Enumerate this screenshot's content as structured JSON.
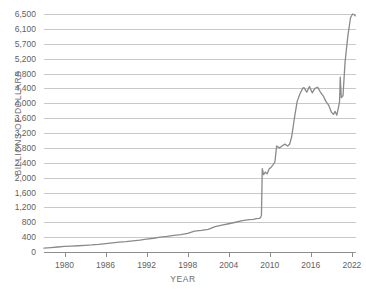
{
  "chart_data": {
    "type": "line",
    "title": "",
    "xlabel": "YEAR",
    "ylabel": "BILLIONS OF DOLLARS",
    "xlim": [
      1977,
      2022.6
    ],
    "ylim": [
      0,
      6500
    ],
    "grid": true,
    "legend": false,
    "line_color": "#8a8a8a",
    "xticks": [
      1980,
      1986,
      1992,
      1998,
      2004,
      2010,
      2016,
      2022
    ],
    "xtick_labels": [
      "1980",
      "1986",
      "1992",
      "1998",
      "2004",
      "2010",
      "2016",
      "2022"
    ],
    "yticks": [
      0,
      400,
      800,
      1200,
      1600,
      2000,
      2400,
      2800,
      3200,
      3600,
      4000,
      4400,
      4800,
      5200,
      5700,
      6100,
      6500
    ],
    "ytick_labels": [
      "0",
      "400",
      "800",
      "1,200",
      "1,600",
      "2,000",
      "2,400",
      "2,800",
      "3,200",
      "3,600",
      "4,000",
      "4,400",
      "4,800",
      "5,200",
      "5,700",
      "6,100",
      "6,500"
    ],
    "series": [
      {
        "name": "Total Assets",
        "x": [
          1977.0,
          1978.0,
          1979.0,
          1980.0,
          1981.0,
          1982.0,
          1983.0,
          1984.0,
          1985.0,
          1986.0,
          1987.0,
          1988.0,
          1989.0,
          1990.0,
          1991.0,
          1992.0,
          1993.0,
          1994.0,
          1995.0,
          1996.0,
          1997.0,
          1998.0,
          1999.0,
          2000.0,
          2001.0,
          2002.0,
          2003.0,
          2004.0,
          2005.0,
          2006.0,
          2007.0,
          2007.6,
          2008.0,
          2008.45,
          2008.62,
          2008.78,
          2008.9,
          2009.1,
          2009.35,
          2009.6,
          2009.9,
          2010.2,
          2010.5,
          2010.75,
          2011.0,
          2011.4,
          2011.8,
          2012.2,
          2012.6,
          2012.9,
          2013.2,
          2013.6,
          2014.0,
          2014.4,
          2014.8,
          2015.0,
          2015.4,
          2015.8,
          2016.2,
          2016.6,
          2017.0,
          2017.4,
          2017.8,
          2018.2,
          2018.6,
          2019.0,
          2019.3,
          2019.55,
          2019.8,
          2020.05,
          2020.2,
          2020.3,
          2020.45,
          2020.7,
          2021.0,
          2021.4,
          2021.8,
          2022.1,
          2022.35,
          2022.5
        ],
        "y": [
          105,
          120,
          135,
          150,
          160,
          168,
          180,
          190,
          205,
          225,
          248,
          265,
          280,
          300,
          320,
          345,
          370,
          400,
          420,
          445,
          470,
          500,
          560,
          580,
          610,
          680,
          720,
          760,
          800,
          845,
          870,
          880,
          900,
          905,
          920,
          980,
          2240,
          2080,
          2150,
          2100,
          2230,
          2280,
          2350,
          2420,
          2850,
          2800,
          2850,
          2900,
          2850,
          2900,
          3100,
          3600,
          4050,
          4250,
          4400,
          4420,
          4300,
          4450,
          4280,
          4400,
          4430,
          4300,
          4200,
          4050,
          3950,
          3760,
          3700,
          3780,
          3680,
          3900,
          4050,
          4700,
          4150,
          4200,
          5100,
          5900,
          6400,
          6500,
          6480,
          6450
        ]
      }
    ]
  }
}
